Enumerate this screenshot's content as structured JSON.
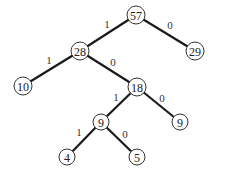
{
  "diagram": {
    "type": "huffman-tree",
    "nodes": [
      {
        "id": "n57",
        "value": "57",
        "x": 136,
        "y": 15
      },
      {
        "id": "n28",
        "value": "28",
        "x": 80,
        "y": 51
      },
      {
        "id": "n29",
        "value": "29",
        "x": 195,
        "y": 51
      },
      {
        "id": "n10",
        "value": "10",
        "x": 23,
        "y": 86
      },
      {
        "id": "n18",
        "value": "18",
        "x": 137,
        "y": 87
      },
      {
        "id": "n9a",
        "value": "9",
        "x": 101,
        "y": 122
      },
      {
        "id": "n9b",
        "value": "9",
        "x": 180,
        "y": 122
      },
      {
        "id": "n4",
        "value": "4",
        "x": 67,
        "y": 157
      },
      {
        "id": "n5",
        "value": "5",
        "x": 137,
        "y": 157
      }
    ],
    "edges": [
      {
        "from": "n57",
        "to": "n28",
        "label": "1",
        "lx": 107,
        "ly": 24
      },
      {
        "from": "n57",
        "to": "n29",
        "label": "0",
        "lx": 170,
        "ly": 25
      },
      {
        "from": "n28",
        "to": "n10",
        "label": "1",
        "lx": 49,
        "ly": 60
      },
      {
        "from": "n28",
        "to": "n18",
        "label": "0",
        "lx": 113,
        "ly": 62
      },
      {
        "from": "n18",
        "to": "n9a",
        "label": "1",
        "lx": 116,
        "ly": 97
      },
      {
        "from": "n18",
        "to": "n9b",
        "label": "0",
        "lx": 162,
        "ly": 98
      },
      {
        "from": "n9a",
        "to": "n4",
        "label": "1",
        "lx": 79,
        "ly": 132
      },
      {
        "from": "n9a",
        "to": "n5",
        "label": "0",
        "lx": 125,
        "ly": 134
      }
    ]
  }
}
